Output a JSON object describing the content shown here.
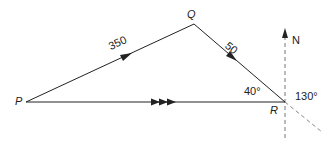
{
  "diagram": {
    "points": [
      {
        "id": "P",
        "label": "P",
        "x": 26,
        "y": 102
      },
      {
        "id": "Q",
        "label": "Q",
        "x": 194,
        "y": 24
      },
      {
        "id": "R",
        "label": "R",
        "x": 285,
        "y": 102
      }
    ],
    "edges": [
      {
        "from": "P",
        "to": "Q",
        "label": "350",
        "arrow": "single"
      },
      {
        "from": "Q",
        "to": "R",
        "label": "50",
        "arrow": "single"
      },
      {
        "from": "P",
        "to": "R",
        "label": "",
        "arrow": "triple"
      }
    ],
    "angles": {
      "at_R_interior": "40°",
      "bearing_at_R": "130°"
    },
    "north_label": "N",
    "colors": {
      "line": "#222222",
      "dashed": "#777777"
    }
  },
  "labels": {
    "P": "P",
    "Q": "Q",
    "R": "R",
    "PQ": "350",
    "QR": "50",
    "angle40": "40°",
    "angle130": "130°",
    "north": "N"
  }
}
